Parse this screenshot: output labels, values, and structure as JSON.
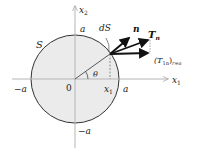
{
  "diagram": {
    "surface_label": "S",
    "element_label": "dS",
    "angle_label": "θ",
    "origin_label": "0",
    "axes": {
      "x1": {
        "label": "x",
        "sub": "1"
      },
      "x2": {
        "label": "x",
        "sub": "2"
      }
    },
    "ticks": {
      "pos_x": "a",
      "neg_x": "−a",
      "pos_y": "a",
      "neg_y": "−a",
      "x1_point": {
        "label": "x",
        "sub": "1"
      }
    },
    "vectors": {
      "normal": "n",
      "traction": {
        "label": "T",
        "sub": "n"
      },
      "component": {
        "open": "(T",
        "sub": "1n",
        "close": ")",
        "subscript2": "r=a"
      }
    },
    "colors": {
      "fill": "#ebebeb",
      "stroke": "#333333",
      "axis": "#b5b5b5"
    }
  }
}
